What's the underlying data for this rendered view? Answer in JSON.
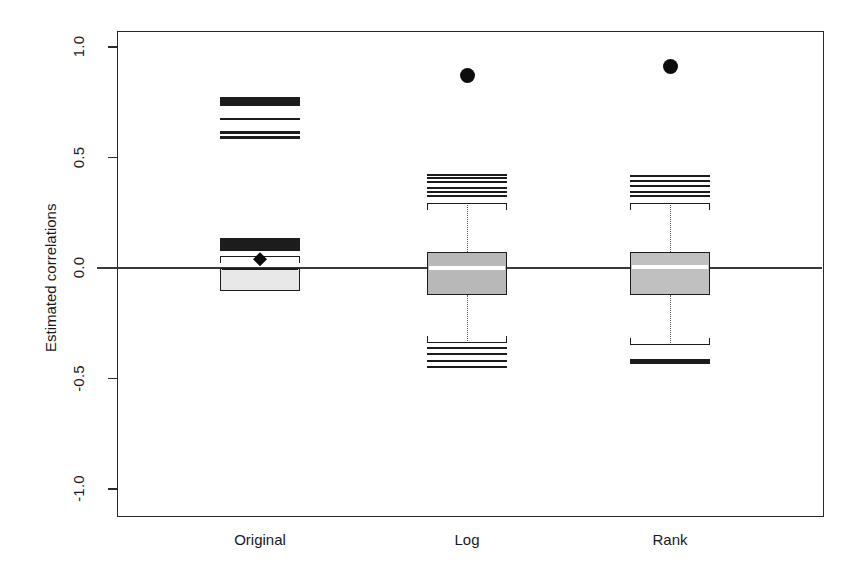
{
  "chart_data": {
    "type": "box",
    "title": "",
    "xlabel": "",
    "ylabel": "Estimated correlations",
    "ylim": [
      -1.0,
      1.0
    ],
    "ytick_labels": [
      "1.0",
      "0.5",
      "0.0",
      "-0.5",
      "-1.0"
    ],
    "ytick_values": [
      1.0,
      0.5,
      0.0,
      -0.5,
      -1.0
    ],
    "categories": [
      "Original",
      "Log",
      "Rank"
    ],
    "grid": false,
    "legend": "none",
    "reference_line": 0.0,
    "groups": [
      {
        "name": "Original",
        "q1": -0.105,
        "median": -0.005,
        "q3": 0.0,
        "whisker_low": -0.105,
        "whisker_high": 0.055,
        "mean_marker": 0.04,
        "box_fill": "#e8e8e8",
        "outlier_bands": [
          {
            "center": 0.755,
            "thickness": 0.04
          },
          {
            "center": 0.675,
            "thickness": 0.009
          },
          {
            "center": 0.615,
            "thickness": 0.013
          },
          {
            "center": 0.59,
            "thickness": 0.016
          },
          {
            "center": 0.108,
            "thickness": 0.059
          }
        ],
        "outlier_points": []
      },
      {
        "name": "Log",
        "q1": -0.122,
        "median": 0.0,
        "q3": 0.073,
        "whisker_low": -0.339,
        "whisker_high": 0.294,
        "box_fill": "#b8b8b8",
        "outlier_bands": [
          {
            "center": 0.421,
            "thickness": 0.009
          },
          {
            "center": 0.407,
            "thickness": 0.009
          },
          {
            "center": 0.389,
            "thickness": 0.009
          },
          {
            "center": 0.362,
            "thickness": 0.009
          },
          {
            "center": 0.344,
            "thickness": 0.009
          },
          {
            "center": 0.326,
            "thickness": 0.009
          },
          {
            "center": -0.362,
            "thickness": 0.013
          },
          {
            "center": -0.389,
            "thickness": 0.009
          },
          {
            "center": -0.421,
            "thickness": 0.009
          },
          {
            "center": -0.448,
            "thickness": 0.009
          }
        ],
        "outlier_points": [
          0.873
        ]
      },
      {
        "name": "Rank",
        "q1": -0.122,
        "median": 0.005,
        "q3": 0.073,
        "whisker_low": -0.348,
        "whisker_high": 0.294,
        "box_fill": "#c0c0c0",
        "outlier_bands": [
          {
            "center": 0.416,
            "thickness": 0.009
          },
          {
            "center": 0.394,
            "thickness": 0.009
          },
          {
            "center": 0.371,
            "thickness": 0.013
          },
          {
            "center": 0.344,
            "thickness": 0.013
          },
          {
            "center": 0.326,
            "thickness": 0.013
          },
          {
            "center": -0.425,
            "thickness": 0.022
          }
        ],
        "outlier_points": [
          0.914
        ]
      }
    ]
  }
}
